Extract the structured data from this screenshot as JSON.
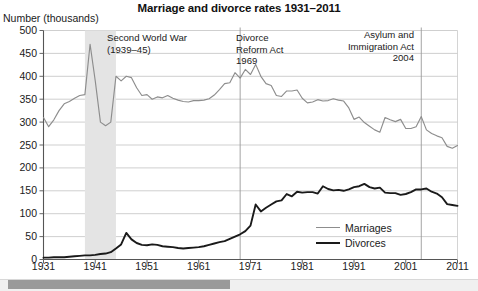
{
  "chart_data": {
    "type": "line",
    "title": "Marriage and divorce rates 1931–2011",
    "ylabel": "Number (thousands)",
    "xlabel": "",
    "xlim": [
      1931,
      2011
    ],
    "ylim": [
      0,
      500
    ],
    "grid": "horizontal",
    "legend_position": "bottom-right",
    "y_ticks": [
      "500",
      "450",
      "400",
      "350",
      "300",
      "250",
      "200",
      "150",
      "100",
      "50",
      "0"
    ],
    "y_tick_values": [
      500,
      450,
      400,
      350,
      300,
      250,
      200,
      150,
      100,
      50,
      0
    ],
    "x_ticks": [
      "1931",
      "1941",
      "1951",
      "1961",
      "1971",
      "1981",
      "1991",
      "2001",
      "2011"
    ],
    "x_tick_values": [
      1931,
      1941,
      1951,
      1961,
      1971,
      1981,
      1991,
      2001,
      2011
    ],
    "series": [
      {
        "name": "Marriages",
        "color": "#8d8d8d",
        "x": [
          1931,
          1932,
          1933,
          1934,
          1935,
          1936,
          1937,
          1938,
          1939,
          1940,
          1941,
          1942,
          1943,
          1944,
          1945,
          1946,
          1947,
          1948,
          1949,
          1950,
          1951,
          1952,
          1953,
          1954,
          1955,
          1956,
          1957,
          1958,
          1959,
          1960,
          1961,
          1962,
          1963,
          1964,
          1965,
          1966,
          1967,
          1968,
          1969,
          1970,
          1971,
          1972,
          1973,
          1974,
          1975,
          1976,
          1977,
          1978,
          1979,
          1980,
          1981,
          1982,
          1983,
          1984,
          1985,
          1986,
          1987,
          1988,
          1989,
          1990,
          1991,
          1992,
          1993,
          1994,
          1995,
          1996,
          1997,
          1998,
          1999,
          2000,
          2001,
          2002,
          2003,
          2004,
          2005,
          2006,
          2007,
          2008,
          2009,
          2010,
          2011
        ],
        "values": [
          310,
          290,
          305,
          325,
          340,
          345,
          352,
          358,
          360,
          470,
          390,
          300,
          292,
          300,
          400,
          390,
          400,
          397,
          375,
          358,
          360,
          350,
          355,
          353,
          358,
          352,
          348,
          345,
          344,
          347,
          347,
          348,
          351,
          359,
          371,
          384,
          386,
          408,
          396,
          415,
          404,
          426,
          400,
          384,
          380,
          358,
          356,
          368,
          368,
          370,
          352,
          342,
          344,
          349,
          346,
          347,
          351,
          348,
          346,
          331,
          306,
          311,
          299,
          291,
          283,
          278,
          310,
          305,
          301,
          306,
          286,
          286,
          290,
          312,
          283,
          275,
          270,
          266,
          247,
          243,
          249
        ],
        "peaks": [
          {
            "year": 1940,
            "value": 470,
            "note": "wartime marriage peak"
          },
          {
            "year": 1972,
            "value": 426,
            "note": "post Divorce Reform Act peak"
          }
        ],
        "end_value": 249
      },
      {
        "name": "Divorces",
        "color": "#1a1a1a",
        "x": [
          1931,
          1932,
          1933,
          1934,
          1935,
          1936,
          1937,
          1938,
          1939,
          1940,
          1941,
          1942,
          1943,
          1944,
          1945,
          1946,
          1947,
          1948,
          1949,
          1950,
          1951,
          1952,
          1953,
          1954,
          1955,
          1956,
          1957,
          1958,
          1959,
          1960,
          1961,
          1962,
          1963,
          1964,
          1965,
          1966,
          1967,
          1968,
          1969,
          1970,
          1971,
          1972,
          1973,
          1974,
          1975,
          1976,
          1977,
          1978,
          1979,
          1980,
          1981,
          1982,
          1983,
          1984,
          1985,
          1986,
          1987,
          1988,
          1989,
          1990,
          1991,
          1992,
          1993,
          1994,
          1995,
          1996,
          1997,
          1998,
          1999,
          2000,
          2001,
          2002,
          2003,
          2004,
          2005,
          2006,
          2007,
          2008,
          2009,
          2010,
          2011
        ],
        "values": [
          4,
          4,
          5,
          5,
          5,
          6,
          7,
          8,
          9,
          9,
          10,
          12,
          13,
          16,
          24,
          33,
          58,
          44,
          36,
          32,
          31,
          33,
          32,
          29,
          28,
          27,
          25,
          24,
          25,
          26,
          27,
          29,
          32,
          35,
          38,
          40,
          45,
          50,
          55,
          62,
          74,
          120,
          105,
          113,
          120,
          127,
          129,
          143,
          138,
          148,
          146,
          147,
          147,
          144,
          160,
          154,
          151,
          152,
          150,
          153,
          158,
          160,
          165,
          158,
          155,
          157,
          146,
          145,
          145,
          141,
          143,
          147,
          153,
          153,
          155,
          148,
          144,
          136,
          121,
          119,
          117
        ],
        "peaks": [
          {
            "year": 1972,
            "value": 120,
            "note": "surge following Divorce Reform Act"
          },
          {
            "year": 1985,
            "value": 160,
            "note": "mid-1980s high"
          },
          {
            "year": 1993,
            "value": 165,
            "note": "peak"
          }
        ],
        "end_value": 117
      }
    ],
    "annotations": [
      {
        "id": "second-world-war",
        "text": "Second World War\n(1939–45)",
        "type": "shaded-band",
        "band_start": 1939,
        "band_end": 1945,
        "band_color": "#e4e4e4"
      },
      {
        "id": "divorce-reform-act",
        "text": "Divorce\nReform Act\n1969",
        "type": "vertical-line",
        "year": 1969
      },
      {
        "id": "asylum-immigration-act",
        "text": "Asylum and\nImmigration Act\n2004",
        "type": "vertical-line",
        "year": 2004
      }
    ]
  },
  "legend": {
    "items": [
      {
        "label": "Marriages",
        "color": "#8d8d8d"
      },
      {
        "label": "Divorces",
        "color": "#1a1a1a"
      }
    ]
  },
  "scrollbar": {
    "orientation": "horizontal",
    "thumb_label": ""
  }
}
